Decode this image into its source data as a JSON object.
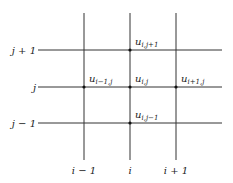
{
  "diagram": {
    "row_labels": [
      "j + 1",
      "j",
      "j − 1"
    ],
    "col_labels": [
      "i − 1",
      "i",
      "i + 1"
    ],
    "nodes": [
      {
        "name": "u",
        "sub": "i,j+1",
        "row": 0,
        "col": 1
      },
      {
        "name": "u",
        "sub": "i−1,j",
        "row": 1,
        "col": 0
      },
      {
        "name": "u",
        "sub": "i,j",
        "row": 1,
        "col": 1
      },
      {
        "name": "u",
        "sub": "i+1,j",
        "row": 1,
        "col": 2
      },
      {
        "name": "u",
        "sub": "i,j−1",
        "row": 2,
        "col": 1
      }
    ]
  }
}
